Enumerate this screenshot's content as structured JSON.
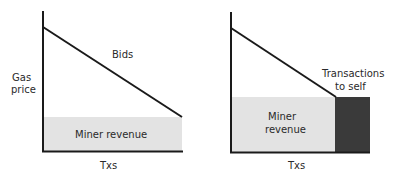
{
  "left_chart": {
    "y_label_line1": "Gas",
    "y_label_line2": "price",
    "x_label": "Txs",
    "curve_label": "Bids",
    "area_label": "Miner revenue"
  },
  "right_chart": {
    "x_label": "Txs",
    "area_label_line1": "Miner",
    "area_label_line2": "revenue",
    "self_label_line1": "Transactions",
    "self_label_line2": "to self"
  },
  "colors": {
    "axis": "#1a1a1a",
    "revenue_fill": "#e3e3e3",
    "self_fill": "#3a3a3a",
    "text": "#2a2a2a"
  }
}
